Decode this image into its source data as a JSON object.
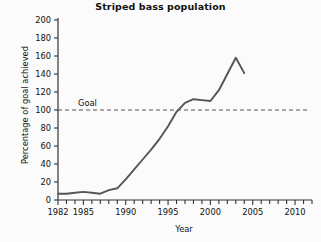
{
  "chart_data": {
    "type": "line",
    "title": "Striped bass population",
    "xlabel": "Year",
    "ylabel": "Percentage of goal achieved",
    "xlim": [
      1982,
      2012
    ],
    "ylim": [
      0,
      200
    ],
    "grid": false,
    "legend": null,
    "x_ticks_major": [
      "1982",
      "1985",
      "1990",
      "1995",
      "2000",
      "2005",
      "2010"
    ],
    "x_ticks_major_values": [
      1982,
      1985,
      1990,
      1995,
      2000,
      2005,
      2010
    ],
    "x_tick_minor_step": 1,
    "y_ticks": [
      "0",
      "20",
      "40",
      "60",
      "80",
      "100",
      "120",
      "140",
      "160",
      "180",
      "200"
    ],
    "y_tick_values": [
      0,
      20,
      40,
      60,
      80,
      100,
      120,
      140,
      160,
      180,
      200
    ],
    "series": [
      {
        "name": "Percentage of goal achieved",
        "color": "#555555",
        "x": [
          1982,
          1983,
          1984,
          1985,
          1986,
          1987,
          1988,
          1989,
          1990,
          1991,
          1992,
          1993,
          1994,
          1995,
          1996,
          1997,
          1998,
          1999,
          2000,
          2001,
          2002,
          2003,
          2004
        ],
        "values": [
          7,
          7,
          8,
          9,
          8,
          7,
          11,
          13,
          23,
          34,
          45,
          56,
          68,
          82,
          98,
          108,
          112,
          111,
          110,
          122,
          140,
          158,
          141
        ]
      }
    ],
    "annotations": [
      {
        "name": "goal-line",
        "label": "Goal",
        "y_value": 100,
        "style": "dashed",
        "color": "#555555"
      }
    ]
  },
  "axes": {
    "y_axis_name": "y-axis",
    "x_axis_name": "x-axis"
  }
}
